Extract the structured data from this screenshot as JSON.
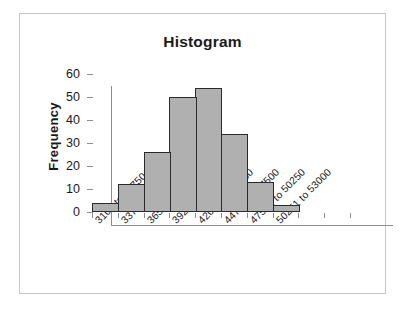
{
  "chart": {
    "title": "Histogram",
    "y_axis_title": "Frequency",
    "y_ticks": [
      "0",
      "10",
      "20",
      "30",
      "40",
      "50",
      "60"
    ]
  },
  "chart_data": {
    "type": "bar",
    "title": "Histogram",
    "xlabel": "",
    "ylabel": "Frequency",
    "ylim": [
      0,
      60
    ],
    "yticks": [
      0,
      10,
      20,
      30,
      40,
      50,
      60
    ],
    "grid": false,
    "legend": false,
    "bar_color": "#b0b0b0",
    "bar_edge_color": "#2b2b2b",
    "categories": [
      "3100 to 33750",
      "33751 to 36500",
      "36501 to 39250",
      "39251 to 42000",
      "42001 to 44750",
      "44751 to 47500",
      "47501 to 50250",
      "50251 to 53000"
    ],
    "values": [
      4,
      12,
      26,
      50,
      54,
      34,
      13,
      3
    ]
  }
}
